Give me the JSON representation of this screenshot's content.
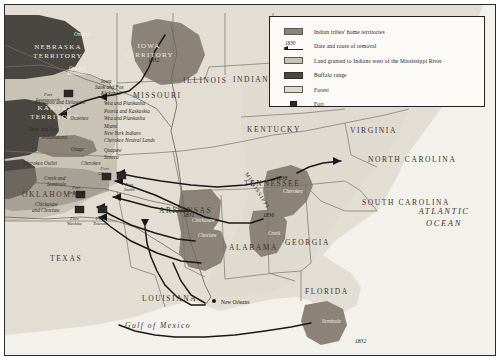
{
  "map": {
    "title": "Indian Removal",
    "legend": {
      "items": [
        {
          "icon": "swatch-territories",
          "label": "Indian tribes' home territories",
          "color": "#8b8378"
        },
        {
          "icon": "route-arrow",
          "label": "Date and route of removal",
          "date": "1830",
          "color": "#191714"
        },
        {
          "icon": "swatch-granted",
          "label": "Land granted to Indians west of the Mississippi River",
          "color": "#c9c3b6"
        },
        {
          "icon": "swatch-buffalo",
          "label": "Buffalo range",
          "color": "#4a4742"
        },
        {
          "icon": "swatch-forest",
          "label": "Forest",
          "color": "#dedacf"
        },
        {
          "icon": "swatch-fort",
          "label": "Fort",
          "color": "#2b2926"
        }
      ]
    },
    "states": [
      {
        "name": "NEBRASKA TERRITORY",
        "x": 20,
        "y": 38,
        "cls": "terr"
      },
      {
        "name": "KANSAS TERRITORY",
        "x": 17,
        "y": 99,
        "cls": "terr"
      },
      {
        "name": "IOWA TERRITORY",
        "x": 111,
        "y": 37,
        "cls": "terr"
      },
      {
        "name": "ILLINOIS",
        "x": 178,
        "y": 71,
        "cls": "state"
      },
      {
        "name": "INDIANA",
        "x": 228,
        "y": 70,
        "cls": "state"
      },
      {
        "name": "MISSOURI",
        "x": 128,
        "y": 86,
        "cls": "state"
      },
      {
        "name": "KENTUCKY",
        "x": 242,
        "y": 120,
        "cls": "state"
      },
      {
        "name": "VIRGINIA",
        "x": 345,
        "y": 121,
        "cls": "state"
      },
      {
        "name": "TENNESSEE",
        "x": 239,
        "y": 174,
        "cls": "state"
      },
      {
        "name": "ARKANSAS",
        "x": 154,
        "y": 201,
        "cls": "state"
      },
      {
        "name": "OKLAHOMA",
        "x": 17,
        "y": 185,
        "cls": "state"
      },
      {
        "name": "TEXAS",
        "x": 45,
        "y": 249,
        "cls": "state"
      },
      {
        "name": "LOUISIANA",
        "x": 137,
        "y": 289,
        "cls": "state"
      },
      {
        "name": "ALABAMA",
        "x": 224,
        "y": 238,
        "cls": "state"
      },
      {
        "name": "GEORGIA",
        "x": 280,
        "y": 233,
        "cls": "state"
      },
      {
        "name": "FLORIDA",
        "x": 300,
        "y": 282,
        "cls": "state"
      },
      {
        "name": "NORTH CAROLINA",
        "x": 363,
        "y": 150,
        "cls": "state"
      },
      {
        "name": "SOUTH CAROLINA",
        "x": 357,
        "y": 193,
        "cls": "state"
      }
    ],
    "tribes": [
      {
        "name": "Omaha",
        "x": 69,
        "y": 26,
        "light": true
      },
      {
        "name": "Oto and",
        "x": 64,
        "y": 60,
        "light": true
      },
      {
        "name": "Missouri",
        "x": 62,
        "y": 65,
        "light": true
      },
      {
        "name": "Kickapoo and Delaware",
        "x": 30,
        "y": 94,
        "light": false
      },
      {
        "name": "Shawnee",
        "x": 65,
        "y": 110,
        "light": false
      },
      {
        "name": "Sauk and Fox",
        "x": 24,
        "y": 121,
        "light": false
      },
      {
        "name": "Potawatomi",
        "x": 37,
        "y": 129,
        "light": false
      },
      {
        "name": "Iowa",
        "x": 96,
        "y": 73,
        "light": false
      },
      {
        "name": "Sauk and Fox",
        "x": 90,
        "y": 79,
        "light": false
      },
      {
        "name": "Kickapoo",
        "x": 96,
        "y": 85,
        "light": false
      },
      {
        "name": "Wea and Piankasha",
        "x": 99,
        "y": 95,
        "light": false
      },
      {
        "name": "Peoria and Kaskaskia",
        "x": 99,
        "y": 103,
        "light": false
      },
      {
        "name": "Wea and Piankasha",
        "x": 99,
        "y": 110,
        "light": false
      },
      {
        "name": "Miami",
        "x": 99,
        "y": 118,
        "light": false
      },
      {
        "name": "New York Indians",
        "x": 99,
        "y": 125,
        "light": false
      },
      {
        "name": "Cherokee Neutral Lands",
        "x": 99,
        "y": 132,
        "light": false
      },
      {
        "name": "Quapaw",
        "x": 99,
        "y": 142,
        "light": false
      },
      {
        "name": "Seneca",
        "x": 99,
        "y": 149,
        "light": false
      },
      {
        "name": "Osage",
        "x": 66,
        "y": 141,
        "light": false
      },
      {
        "name": "Cherokee Outlet",
        "x": 18,
        "y": 155,
        "light": false
      },
      {
        "name": "Cherokee",
        "x": 76,
        "y": 155,
        "light": false
      },
      {
        "name": "Creek and",
        "x": 39,
        "y": 170,
        "light": false
      },
      {
        "name": "Seminole",
        "x": 42,
        "y": 176,
        "light": false
      },
      {
        "name": "Chickasaw",
        "x": 30,
        "y": 196,
        "light": false
      },
      {
        "name": "and Choctaw",
        "x": 27,
        "y": 202,
        "light": false
      },
      {
        "name": "Chickasaw",
        "x": 187,
        "y": 212,
        "light": true
      },
      {
        "name": "Choctaw",
        "x": 193,
        "y": 227,
        "light": true
      },
      {
        "name": "Cherokee",
        "x": 278,
        "y": 183,
        "light": true
      },
      {
        "name": "Creek",
        "x": 263,
        "y": 225,
        "light": true
      },
      {
        "name": "Seminole",
        "x": 317,
        "y": 313,
        "light": true
      }
    ],
    "forts": [
      {
        "name": "Fort Leavenworth",
        "x": 31,
        "y": 87,
        "px": 63,
        "py": 89,
        "align": "right"
      },
      {
        "name": "Fort Gibson",
        "x": 93,
        "y": 161,
        "px": 101,
        "py": 172,
        "align": "center"
      },
      {
        "name": "Fort Arbuckle",
        "x": 63,
        "y": 180,
        "px": 75,
        "py": 190,
        "align": "center"
      },
      {
        "name": "Fort Washita",
        "x": 62,
        "y": 211,
        "px": 74,
        "py": 205,
        "align": "center"
      },
      {
        "name": "Fort Towson",
        "x": 88,
        "y": 211,
        "px": 97,
        "py": 205,
        "align": "center"
      },
      {
        "name": "Fort Smith",
        "x": 119,
        "y": 177,
        "px": 116,
        "py": 171,
        "align": "center"
      }
    ],
    "routes": [
      {
        "date": "1832",
        "x": 143,
        "y": 52
      },
      {
        "date": "1838",
        "x": 271,
        "y": 170
      },
      {
        "date": "1831",
        "x": 178,
        "y": 207
      },
      {
        "date": "1836",
        "x": 258,
        "y": 207
      },
      {
        "date": "1832",
        "x": 350,
        "y": 333
      }
    ],
    "water": {
      "ocean_line1": "ATLANTIC",
      "ocean_line2": "OCEAN",
      "gulf": "Gulf of Mexico",
      "river": "MISSISSIPPI"
    },
    "cities": [
      {
        "name": "New Orleans",
        "x": 216,
        "y": 294,
        "px": 209,
        "py": 296
      }
    ]
  }
}
